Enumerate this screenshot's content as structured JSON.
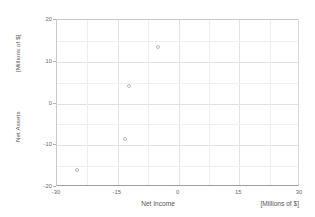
{
  "chart_data": {
    "type": "scatter",
    "title": "",
    "xlabel": "Net Income",
    "xunits": "[Millions of $]",
    "ylabel": "Net Assets",
    "yunits": "[Millions of $]",
    "xlim": [
      -30,
      30
    ],
    "ylim": [
      -20,
      20
    ],
    "xticks": [
      -30,
      -15,
      0,
      15,
      30
    ],
    "yticks": [
      -20,
      -10,
      0,
      10,
      20
    ],
    "xtick_labels": [
      "-30",
      "-15",
      "0",
      "15",
      "30"
    ],
    "ytick_labels": [
      "-20",
      "-10",
      "0",
      "10",
      "20"
    ],
    "grid": true,
    "legend": false,
    "marker_color": "#b9b9b9",
    "grid_color": "#e2e2e2",
    "axis_color": "#9e9e9e",
    "points": [
      {
        "x": -25.0,
        "y": -16.0
      },
      {
        "x": -13.2,
        "y": -8.4
      },
      {
        "x": -12.2,
        "y": 4.1
      },
      {
        "x": -5.1,
        "y": 13.5
      }
    ]
  }
}
